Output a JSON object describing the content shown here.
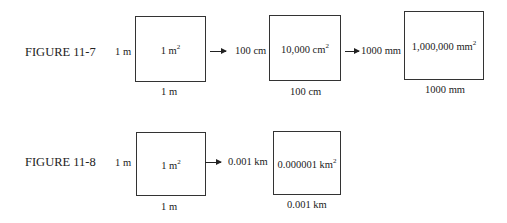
{
  "figures": [
    {
      "label": "FIGURE 11-7",
      "boxes": [
        {
          "side_label": "1 m",
          "area": "1 m",
          "area_exp": "2",
          "bottom_label": "1 m"
        },
        {
          "side_label": "100 cm",
          "area": "10,000 cm",
          "area_exp": "2",
          "bottom_label": "100 cm"
        },
        {
          "side_label": "1000 mm",
          "area": "1,000,000 mm",
          "area_exp": "2",
          "bottom_label": "1000 mm"
        }
      ]
    },
    {
      "label": "FIGURE 11-8",
      "boxes": [
        {
          "side_label": "1 m",
          "area": "1 m",
          "area_exp": "2",
          "bottom_label": "1 m"
        },
        {
          "side_label": "0.001 km",
          "area": "0.000001 km",
          "area_exp": "2",
          "bottom_label": "0.001 km"
        }
      ]
    }
  ]
}
